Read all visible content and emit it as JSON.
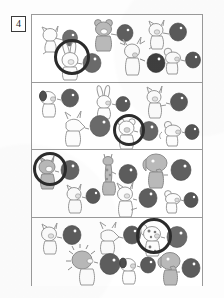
{
  "page": {
    "exercise_number": "4",
    "background_color": "#fdfdfd",
    "frame_color": "#9a9a9a"
  },
  "colors": {
    "balloon_fill": "#6f6f6f",
    "balloon_fill_dark": "#4e4e4e",
    "balloon_highlight": "#ffffff",
    "outline": "#8c8c8c",
    "outline_dark": "#5a5a5a",
    "animal_fill_light": "#fcfcfc",
    "animal_fill_gray": "#b9b9b9",
    "animal_fill_midgray": "#9d9d9d",
    "ring_color": "#2b2b2b"
  },
  "rows": [
    {
      "index": 1,
      "circled_item_index": 3,
      "items": [
        {
          "animal": "cat",
          "label": "cat-with-balloon",
          "balloon": "dark-gray-balloon",
          "circled": false
        },
        {
          "animal": "bear",
          "label": "bear-with-balloon",
          "balloon": "dark-gray-balloon",
          "circled": false
        },
        {
          "animal": "rabbit",
          "label": "rabbit-with-balloon",
          "balloon": "dark-gray-balloon",
          "circled": true
        },
        {
          "animal": "reindeer",
          "label": "reindeer-with-balloon",
          "balloon": "dark-gray-balloon",
          "circled": false
        },
        {
          "animal": "cat",
          "label": "cat-with-balloon",
          "balloon": "dark-gray-balloon",
          "circled": false
        },
        {
          "animal": "mouse",
          "label": "mouse-with-balloon",
          "balloon": "dark-gray-balloon",
          "circled": false
        }
      ]
    },
    {
      "index": 2,
      "circled_item_index": 4,
      "items": [
        {
          "animal": "dog",
          "label": "dog-with-balloon",
          "balloon": "dark-gray-balloon",
          "circled": false
        },
        {
          "animal": "rabbit",
          "label": "rabbit-with-balloon",
          "balloon": "dark-gray-balloon",
          "circled": false
        },
        {
          "animal": "cat",
          "label": "cat-with-balloon",
          "balloon": "dark-gray-balloon",
          "circled": false
        },
        {
          "animal": "wolf",
          "label": "wolf-with-balloon",
          "balloon": "dark-gray-balloon",
          "circled": false
        },
        {
          "animal": "bear",
          "label": "bear-with-balloon",
          "balloon": "dark-gray-balloon",
          "circled": true
        },
        {
          "animal": "mouse",
          "label": "mouse-with-balloon",
          "balloon": "dark-gray-balloon",
          "circled": false
        }
      ]
    },
    {
      "index": 3,
      "circled_item_index": 0,
      "items": [
        {
          "animal": "squirrel",
          "label": "squirrel-with-balloon",
          "balloon": "dark-gray-balloon",
          "circled": true
        },
        {
          "animal": "giraffe",
          "label": "giraffe-with-balloon",
          "balloon": "dark-gray-balloon",
          "circled": false
        },
        {
          "animal": "elephant",
          "label": "elephant-with-balloon",
          "balloon": "dark-gray-balloon",
          "circled": false
        },
        {
          "animal": "cat",
          "label": "cat-with-balloon",
          "balloon": "dark-gray-balloon",
          "circled": false
        },
        {
          "animal": "cat",
          "label": "cat-with-balloon",
          "balloon": "dark-gray-balloon",
          "circled": false
        },
        {
          "animal": "mouse",
          "label": "mouse-with-balloon",
          "balloon": "dark-gray-balloon",
          "circled": false
        }
      ]
    },
    {
      "index": 4,
      "circled_item_index": 3,
      "items": [
        {
          "animal": "cat",
          "label": "cat-with-balloon",
          "balloon": "dark-gray-balloon",
          "circled": false
        },
        {
          "animal": "wolf",
          "label": "wolf-with-balloon",
          "balloon": "dark-gray-balloon",
          "circled": false
        },
        {
          "animal": "hedgehog",
          "label": "hedgehog-with-balloon",
          "balloon": "dark-gray-balloon",
          "circled": false
        },
        {
          "animal": "dalmatian",
          "label": "dalmatian-with-balloon",
          "balloon": "dark-gray-balloon",
          "circled": true
        },
        {
          "animal": "dog",
          "label": "dog-with-balloon",
          "balloon": "dark-gray-balloon",
          "circled": false
        },
        {
          "animal": "elephant",
          "label": "elephant-with-balloon",
          "balloon": "dark-gray-balloon",
          "circled": false
        }
      ]
    }
  ]
}
